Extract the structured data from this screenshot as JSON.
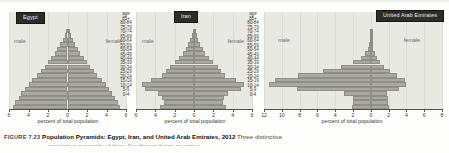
{
  "figure": {
    "number": "FIGURE 7.23",
    "title": "Population Pyramids: Egypt, Iran, and United Arab Emirates, 2012",
    "caption_text": "Three distinctive",
    "caption_line2": "population pyramids of three Southwest Asian countries."
  },
  "common": {
    "age_header": "age",
    "male_label": "male",
    "female_label": "female",
    "axis_title": "percent of total population",
    "bar_color": "#a9a9a1",
    "plot_background": "#e9e9e4",
    "label_box_color": "#2e2c29",
    "age_groups": [
      "85+",
      "80-84",
      "75-79",
      "70-74",
      "65-69",
      "60-64",
      "55-59",
      "50-54",
      "45-49",
      "40-44",
      "35-39",
      "30-34",
      "25-29",
      "20-24",
      "15-19",
      "10-14",
      "5-9",
      "0-4"
    ]
  },
  "chart_data": [
    {
      "type": "bar",
      "title": "Egypt",
      "subtype": "population-pyramid",
      "xlabel": "percent of total population",
      "ylabel": "age",
      "xlim": [
        -6,
        6
      ],
      "tick_labels": [
        "6",
        "4",
        "2",
        "0",
        "2",
        "4",
        "6"
      ],
      "tick_values": [
        -6,
        -4,
        -2,
        0,
        2,
        4,
        6
      ],
      "grid": true,
      "categories": [
        "85+",
        "80-84",
        "75-79",
        "70-74",
        "65-69",
        "60-64",
        "55-59",
        "50-54",
        "45-49",
        "40-44",
        "35-39",
        "30-34",
        "25-29",
        "20-24",
        "15-19",
        "10-14",
        "5-9",
        "0-4"
      ],
      "series": [
        {
          "name": "male",
          "values": [
            0.15,
            0.3,
            0.5,
            0.75,
            1.05,
            1.3,
            1.65,
            2.0,
            2.35,
            2.75,
            3.1,
            3.6,
            4.0,
            4.4,
            4.75,
            5.0,
            5.35,
            5.6
          ]
        },
        {
          "name": "female",
          "values": [
            0.18,
            0.32,
            0.52,
            0.78,
            1.05,
            1.3,
            1.65,
            2.0,
            2.3,
            2.7,
            3.05,
            3.5,
            3.95,
            4.3,
            4.6,
            4.85,
            5.2,
            5.4
          ]
        }
      ]
    },
    {
      "type": "bar",
      "title": "Iran",
      "subtype": "population-pyramid",
      "xlabel": "percent of total population",
      "ylabel": "age",
      "xlim": [
        -6,
        6
      ],
      "tick_labels": [
        "6",
        "4",
        "2",
        "0",
        "2",
        "4",
        "6"
      ],
      "tick_values": [
        -6,
        -4,
        -2,
        0,
        2,
        4,
        6
      ],
      "grid": true,
      "categories": [
        "85+",
        "80-84",
        "75-79",
        "70-74",
        "65-69",
        "60-64",
        "55-59",
        "50-54",
        "45-49",
        "40-44",
        "35-39",
        "30-34",
        "25-29",
        "20-24",
        "15-19",
        "10-14",
        "5-9",
        "0-4"
      ],
      "series": [
        {
          "name": "male",
          "values": [
            0.1,
            0.25,
            0.45,
            0.6,
            0.85,
            1.15,
            1.55,
            2.0,
            2.5,
            2.85,
            3.3,
            4.4,
            5.35,
            5.1,
            3.7,
            3.3,
            3.1,
            3.5
          ]
        },
        {
          "name": "female",
          "values": [
            0.12,
            0.28,
            0.45,
            0.62,
            0.88,
            1.15,
            1.55,
            2.0,
            2.45,
            2.8,
            3.25,
            4.3,
            5.2,
            4.9,
            3.5,
            3.15,
            2.95,
            3.35
          ]
        }
      ]
    },
    {
      "type": "bar",
      "title": "United Arab Emirates",
      "subtype": "population-pyramid",
      "xlabel": "percent of total population",
      "ylabel": "age",
      "xlim": [
        -12,
        8
      ],
      "tick_labels": [
        "12",
        "10",
        "8",
        "6",
        "4",
        "2",
        "0",
        "2",
        "4",
        "6",
        "8"
      ],
      "tick_values": [
        -12,
        -10,
        -8,
        -6,
        -4,
        -2,
        0,
        2,
        4,
        6,
        8
      ],
      "grid": true,
      "categories": [
        "85+",
        "80-84",
        "75-79",
        "70-74",
        "65-69",
        "60-64",
        "55-59",
        "50-54",
        "45-49",
        "40-44",
        "35-39",
        "30-34",
        "25-29",
        "20-24",
        "15-19",
        "10-14",
        "5-9",
        "0-4"
      ],
      "series": [
        {
          "name": "male",
          "values": [
            0.05,
            0.08,
            0.12,
            0.2,
            0.35,
            0.6,
            1.1,
            2.0,
            3.3,
            5.4,
            8.2,
            10.8,
            11.4,
            8.3,
            3.0,
            2.0,
            2.0,
            2.1
          ]
        },
        {
          "name": "female",
          "values": [
            0.05,
            0.08,
            0.12,
            0.18,
            0.3,
            0.45,
            0.7,
            1.0,
            1.5,
            2.2,
            3.0,
            3.8,
            4.0,
            3.2,
            1.8,
            1.9,
            1.9,
            2.0
          ]
        }
      ]
    }
  ]
}
